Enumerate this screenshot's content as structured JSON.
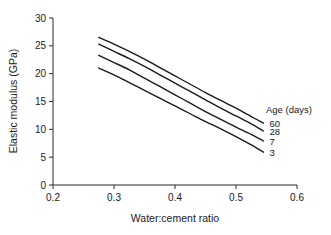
{
  "chart_data": {
    "type": "line",
    "title": "",
    "xlabel": "Water:cement ratio",
    "ylabel": "Elastic modulus (GPa)",
    "xlim": [
      0.2,
      0.6
    ],
    "ylim": [
      0,
      30
    ],
    "xticks": [
      "0.2",
      "0.3",
      "0.4",
      "0.5",
      "0.6"
    ],
    "xtick_values": [
      0.2,
      0.3,
      0.4,
      0.5,
      0.6
    ],
    "yticks": [
      "0",
      "5",
      "10",
      "15",
      "20",
      "25",
      "30"
    ],
    "ytick_values": [
      0,
      5,
      10,
      15,
      20,
      25,
      30
    ],
    "grid": false,
    "legend_position": "right",
    "legend_title": "Age (days)",
    "x": [
      0.275,
      0.3,
      0.325,
      0.35,
      0.375,
      0.4,
      0.425,
      0.45,
      0.475,
      0.5,
      0.525,
      0.545
    ],
    "series": [
      {
        "name": "60",
        "label": "60",
        "values": [
          26.5,
          25.3,
          24.0,
          22.6,
          21.1,
          19.6,
          18.1,
          16.6,
          15.2,
          13.8,
          12.3,
          11.1
        ]
      },
      {
        "name": "28",
        "label": "28",
        "values": [
          25.3,
          24.0,
          22.7,
          21.3,
          19.8,
          18.3,
          16.8,
          15.3,
          13.8,
          12.4,
          11.0,
          9.7
        ]
      },
      {
        "name": "7",
        "label": "7",
        "values": [
          23.3,
          22.0,
          20.7,
          19.2,
          17.7,
          16.2,
          14.7,
          13.2,
          11.8,
          10.4,
          9.1,
          7.9
        ]
      },
      {
        "name": "3",
        "label": "3",
        "values": [
          21.0,
          19.8,
          18.4,
          17.0,
          15.6,
          14.2,
          12.8,
          11.4,
          10.1,
          8.7,
          7.2,
          5.9
        ]
      }
    ],
    "colors": {
      "curve": "#1a1a1a",
      "axis": "#2b2b2b",
      "text": "#1a1a1a",
      "background": "#ffffff"
    }
  }
}
